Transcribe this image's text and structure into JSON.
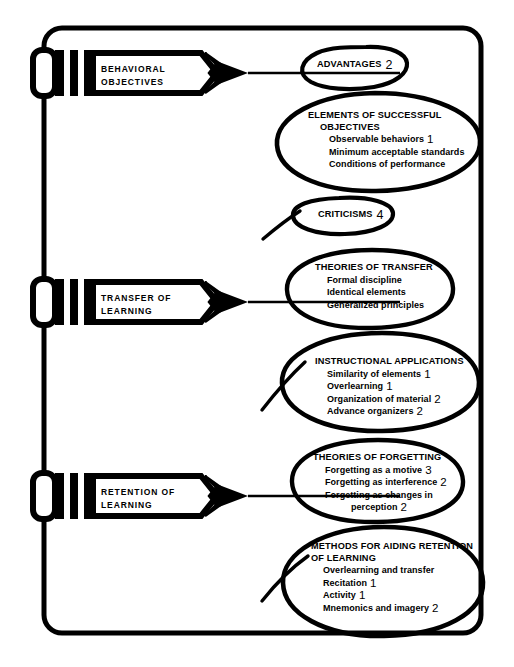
{
  "meta": {
    "background_color": "#ffffff",
    "ink_color": "#000000"
  },
  "frame": {
    "name": "rounded-outer-frame"
  },
  "pencils": [
    {
      "id": "behavioral-objectives",
      "label": "BEHAVIORAL\nOBJECTIVES"
    },
    {
      "id": "transfer-of-learning",
      "label": "TRANSFER OF\nLEARNING"
    },
    {
      "id": "retention-of-learning",
      "label": "RETENTION OF\nLEARNING"
    }
  ],
  "bubbles": [
    {
      "id": "advantages",
      "head": "ADVANTAGES",
      "head_num": "2",
      "items": []
    },
    {
      "id": "elements-of-successful-objectives",
      "head": "ELEMENTS OF SUCCESSFUL",
      "subhead": "OBJECTIVES",
      "items": [
        {
          "text": "Observable behaviors",
          "num": "1"
        },
        {
          "text": "Minimum acceptable standards",
          "num": ""
        },
        {
          "text": "Conditions of performance",
          "num": ""
        }
      ]
    },
    {
      "id": "criticisms",
      "head": "CRITICISMS",
      "head_num": "4",
      "items": []
    },
    {
      "id": "theories-of-transfer",
      "head": "THEORIES OF TRANSFER",
      "items": [
        {
          "text": "Formal discipline",
          "num": ""
        },
        {
          "text": "Identical elements",
          "num": ""
        },
        {
          "text": "Generalized principles",
          "num": ""
        }
      ]
    },
    {
      "id": "instructional-applications",
      "head": "INSTRUCTIONAL APPLICATIONS",
      "items": [
        {
          "text": "Similarity of elements",
          "num": "1"
        },
        {
          "text": "Overlearning",
          "num": "1"
        },
        {
          "text": "Organization of material",
          "num": "2"
        },
        {
          "text": "Advance organizers",
          "num": "2"
        }
      ]
    },
    {
      "id": "theories-of-forgetting",
      "head": "THEORIES OF FORGETTING",
      "items": [
        {
          "text": "Forgetting as a motive",
          "num": "3"
        },
        {
          "text": "Forgetting as interference",
          "num": "2"
        },
        {
          "text": "Forgetting as changes in",
          "num": ""
        },
        {
          "text": "perception",
          "num": "2",
          "extra_indent": true
        }
      ]
    },
    {
      "id": "methods-for-aiding-retention",
      "head": "METHODS FOR AIDING RETENTION",
      "subhead": "OF LEARNING",
      "items": [
        {
          "text": "Overlearning and transfer",
          "num": ""
        },
        {
          "text": "Recitation",
          "num": "1"
        },
        {
          "text": "Activity",
          "num": "1"
        },
        {
          "text": "Mnemonics and imagery",
          "num": "2"
        }
      ]
    }
  ]
}
